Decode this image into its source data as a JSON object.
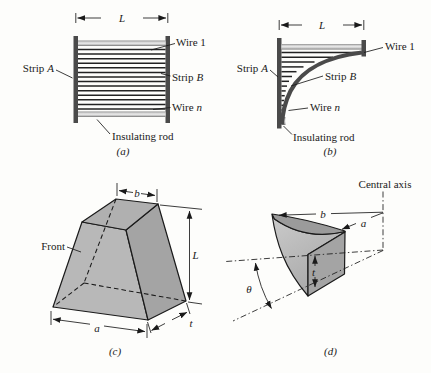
{
  "colors": {
    "ink": "#1a1a1a",
    "strip_dark": "#4a4a4a",
    "rod_light": "#d6d6d6",
    "solid_face_light": "#b8b8b8",
    "solid_face_mid": "#b0b0b0",
    "solid_face_dark": "#a4a4a4",
    "background": "#fdfdfb"
  },
  "panel_a": {
    "caption": "(a)",
    "dim_length": "L",
    "wire_first": "Wire 1",
    "strip_word": "Strip",
    "strip_left_var": "A",
    "strip_right_var": "B",
    "wire_word": "Wire",
    "wire_last_var": "n",
    "insulating_rod": "Insulating rod"
  },
  "panel_b": {
    "caption": "(b)",
    "dim_length": "L",
    "wire_first": "Wire 1",
    "strip_word": "Strip",
    "strip_left_var": "A",
    "strip_right_var": "B",
    "wire_word": "Wire",
    "wire_last_var": "n",
    "insulating_rod": "Insulating rod"
  },
  "panel_c": {
    "caption": "(c)",
    "front_label": "Front",
    "dim_top": "b",
    "dim_height": "L",
    "dim_bottom": "a",
    "dim_thickness": "t"
  },
  "panel_d": {
    "caption": "(d)",
    "central_axis": "Central axis",
    "dim_inner": "b",
    "dim_outer": "a",
    "dim_thickness": "t",
    "angle": "θ"
  }
}
